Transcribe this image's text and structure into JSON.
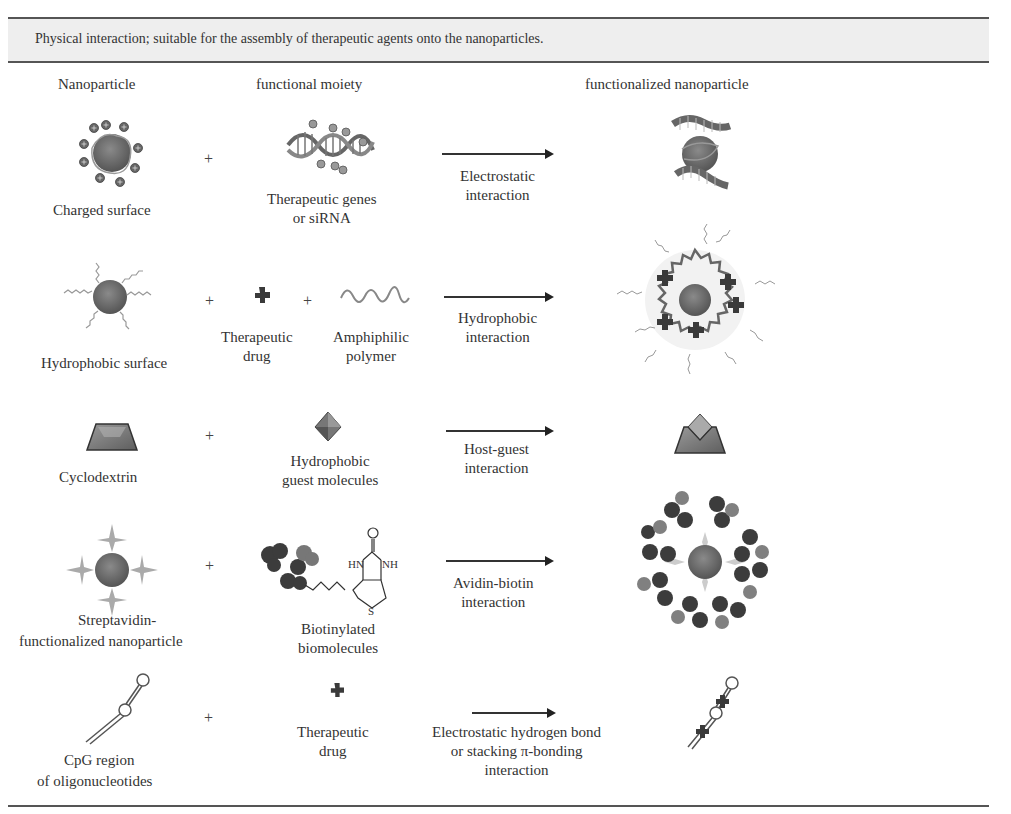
{
  "banner": {
    "text": "Physical interaction; suitable for the assembly of therapeutic agents onto the nanoparticles."
  },
  "headers": {
    "nanoparticle": "Nanoparticle",
    "functional_moiety": "functional moiety",
    "functionalized_nanoparticle": "functionalized nanoparticle"
  },
  "rows": [
    {
      "nanoparticle": {
        "line1": "Charged surface",
        "icon": "charged-nanoparticle-icon"
      },
      "moieties": [
        {
          "line1": "Therapeutic genes",
          "line2": "or siRNA",
          "icon": "dna-helix-icon"
        }
      ],
      "operator": "+",
      "interaction": {
        "line1": "Electrostatic",
        "line2": "interaction"
      },
      "result_icon": "dna-wrapped-nanoparticle-icon"
    },
    {
      "nanoparticle": {
        "line1": "Hydrophobic surface",
        "icon": "hydrophobic-nanoparticle-icon"
      },
      "moieties": [
        {
          "line1": "Therapeutic",
          "line2": "drug",
          "icon": "drug-cross-icon"
        },
        {
          "line1": "Amphiphilic",
          "line2": "polymer",
          "icon": "polymer-wave-icon"
        }
      ],
      "operator": "+",
      "interaction": {
        "line1": "Hydrophobic",
        "line2": "interaction"
      },
      "result_icon": "polymer-micelle-nanoparticle-icon"
    },
    {
      "nanoparticle": {
        "line1": "Cyclodextrin",
        "icon": "cyclodextrin-trapezoid-icon"
      },
      "moieties": [
        {
          "line1": "Hydrophobic",
          "line2": "guest molecules",
          "icon": "guest-diamond-icon"
        }
      ],
      "operator": "+",
      "interaction": {
        "line1": "Host-guest",
        "line2": "interaction"
      },
      "result_icon": "inclusion-complex-icon"
    },
    {
      "nanoparticle": {
        "line1": "Streptavidin-",
        "line2": "functionalized nanoparticle",
        "icon": "streptavidin-nanoparticle-icon"
      },
      "moieties": [
        {
          "line1": "Biotinylated",
          "line2": "biomolecules",
          "icon": "biotinylated-antibody-icon",
          "chem_labels": {
            "o": "O",
            "hn": "HN",
            "nh": "NH",
            "s": "S"
          }
        }
      ],
      "operator": "+",
      "interaction": {
        "line1": "Avidin-biotin",
        "line2": "interaction"
      },
      "result_icon": "antibody-coated-nanoparticle-icon"
    },
    {
      "nanoparticle": {
        "line1": "CpG region",
        "line2": "of oligonucleotides",
        "icon": "cpg-hairpin-icon"
      },
      "moieties": [
        {
          "line1": "Therapeutic",
          "line2": "drug",
          "icon": "drug-cross-icon"
        }
      ],
      "operator": "+",
      "interaction": {
        "line1": "Electrostatic hydrogen bond",
        "line2": "or stacking π-bonding",
        "line3": "interaction"
      },
      "result_icon": "drug-loaded-cpg-icon"
    }
  ],
  "colors": {
    "banner_bg": "#eeeeee",
    "rule": "#555555",
    "particle": "#6a6a6a",
    "drug": "#3a3a3a"
  }
}
